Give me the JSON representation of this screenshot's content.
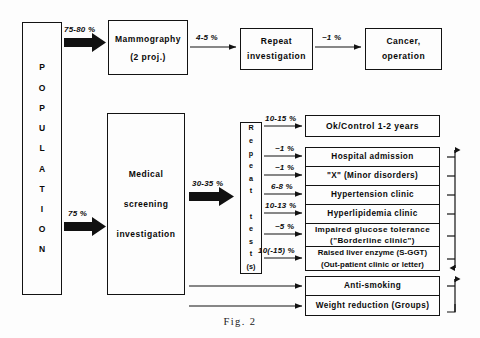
{
  "figure": {
    "caption": "Fig. 2",
    "colors": {
      "ink": "#111111",
      "paper": "#fdfdfd"
    }
  },
  "nodes": {
    "population": {
      "label": "POPULATION",
      "letters": [
        "P",
        "O",
        "P",
        "U",
        "L",
        "A",
        "T",
        "I",
        "O",
        "N"
      ]
    },
    "mammography": {
      "line1": "Mammography",
      "line2": "(2 proj.)"
    },
    "repeat_investigation": {
      "line1": "Repeat",
      "line2": "investigation"
    },
    "cancer": {
      "line1": "Cancer,",
      "line2": "operation"
    },
    "medical_screening": {
      "line1": "Medical",
      "line2": "screening",
      "line3": "investigation"
    },
    "repeat_tests": {
      "label": "Repeat test(s)",
      "letters": [
        "R",
        "e",
        "p",
        "e",
        "a",
        "t",
        "",
        "t",
        "e",
        "s",
        "t",
        "(s)"
      ]
    }
  },
  "outcomes": {
    "ok_control": {
      "label": "Ok/Control 1-2 years"
    },
    "clinic_rows": [
      {
        "line1": "Hospital admission"
      },
      {
        "line1": "\"X\" (Minor disorders)"
      },
      {
        "line1": "Hypertension clinic"
      },
      {
        "line1": "Hyperlipidemia clinic"
      },
      {
        "line1": "Impaired glucose tolerance",
        "line2": "(\"Borderline clinic\")"
      },
      {
        "line1": "Raised liver enzyme (S-GGT)",
        "line2": "(Out-patient clinic or letter)"
      }
    ],
    "lifestyle_rows": [
      {
        "line1": "Anti-smoking"
      },
      {
        "line1": "Weight reduction (Groups)"
      }
    ]
  },
  "flow_labels": {
    "pop_to_mammography": "75-80 %",
    "mammography_to_repeat": "4-5 %",
    "repeat_to_cancer": "~1 %",
    "pop_to_screening": "75 %",
    "screening_to_tests": "30-35 %",
    "tests_to_ok": "10-15 %",
    "tests_to_hospital": "~1 %",
    "tests_to_minor": "~1 %",
    "tests_to_hypertension": "6-8 %",
    "tests_to_hyperlipidemia": "10-13 %",
    "tests_to_glucose": "~5 %",
    "tests_to_liver": "10(-15) %"
  }
}
